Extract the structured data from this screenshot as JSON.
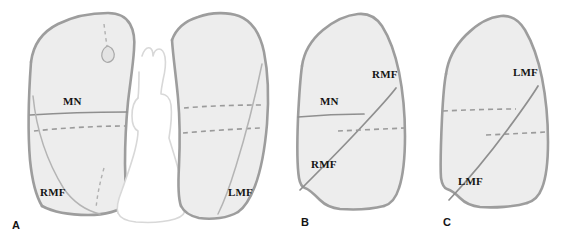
{
  "figure": {
    "background_color": "#ffffff",
    "width": 578,
    "height": 242
  },
  "colors": {
    "lung_fill": "#ededed",
    "lung_outline": "#9d9d9d",
    "fissure_solid": "#8f8f8f",
    "fissure_dashed": "#9b9b9b",
    "mediastinum_fill": "#ffffff",
    "mediastinum_outline": "#d8d8d8",
    "label_text": "#141414"
  },
  "panels": [
    {
      "id": "panel-a",
      "letter": "A",
      "view": "frontal",
      "labels": [
        {
          "name": "minor-fissure-right",
          "text": "MN",
          "x": 63,
          "y": 105
        },
        {
          "name": "right-major-fissure",
          "text": "RMF",
          "x": 40,
          "y": 196
        },
        {
          "name": "left-major-fissure",
          "text": "LMF",
          "x": 228,
          "y": 196
        }
      ]
    },
    {
      "id": "panel-b",
      "letter": "B",
      "view": "right-lateral",
      "labels": [
        {
          "name": "right-major-fissure-upper",
          "text": "RMF",
          "x": 372,
          "y": 78
        },
        {
          "name": "minor-fissure",
          "text": "MN",
          "x": 320,
          "y": 105
        },
        {
          "name": "right-major-fissure-lower",
          "text": "RMF",
          "x": 311,
          "y": 168
        }
      ]
    },
    {
      "id": "panel-c",
      "letter": "C",
      "view": "left-lateral",
      "labels": [
        {
          "name": "left-major-fissure-upper",
          "text": "LMF",
          "x": 513,
          "y": 76
        },
        {
          "name": "left-major-fissure-lower",
          "text": "LMF",
          "x": 458,
          "y": 185
        }
      ]
    }
  ],
  "panel_letters": [
    {
      "name": "panel-letter-a",
      "text": "A",
      "x": 12,
      "y": 229
    },
    {
      "name": "panel-letter-b",
      "text": "B",
      "x": 301,
      "y": 226
    },
    {
      "name": "panel-letter-c",
      "text": "C",
      "x": 443,
      "y": 226
    }
  ],
  "legend_keys": {
    "MN": "Minor (horizontal) fissure",
    "RMF": "Right major (oblique) fissure",
    "LMF": "Left major (oblique) fissure"
  }
}
